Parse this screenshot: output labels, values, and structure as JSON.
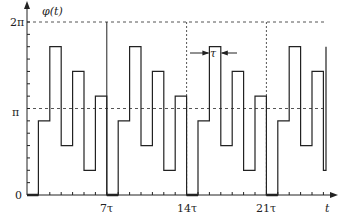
{
  "chart_data": {
    "type": "line",
    "subtype": "step",
    "title": "",
    "ylabel": "φ(t)",
    "xlabel": "t",
    "y_tick_labels": [
      "0",
      "π",
      "2π"
    ],
    "y_tick_values_over_pi": [
      0,
      1,
      2
    ],
    "y_minor_ticks": 14,
    "y_unit": "π/7",
    "x_tick_labels": [
      "7τ",
      "14τ",
      "21τ"
    ],
    "x_tick_values_tau": [
      7,
      14,
      21
    ],
    "x_unit": "τ",
    "ylim": [
      0,
      2
    ],
    "xlim_tau": [
      0,
      26.4
    ],
    "reference_lines": {
      "horizontal_dashed": [
        "π",
        "2π"
      ],
      "vertical": [
        {
          "at": "7τ",
          "style": "solid"
        },
        {
          "at": "14τ",
          "style": "dotted"
        },
        {
          "at": "21τ",
          "style": "dotted"
        }
      ]
    },
    "annotation": {
      "text": "τ",
      "meaning": "segment width",
      "segment_start_tau": 16
    },
    "series": [
      {
        "name": "φ(t)",
        "segment_width": "τ",
        "levels_in_pi_over_7": [
          0,
          6,
          12,
          4,
          10,
          2,
          8,
          0,
          6,
          12,
          4,
          10,
          2,
          8,
          0,
          6,
          12,
          4,
          10,
          2,
          8,
          0,
          6,
          12,
          4,
          10,
          2
        ],
        "period_tau": 7,
        "pattern_per_period": [
          0,
          6,
          12,
          4,
          10,
          2,
          8
        ]
      }
    ]
  },
  "labels": {
    "y_axis": "φ(t)",
    "x_axis": "t",
    "y0": "0",
    "ypi": "π",
    "y2pi": "2π",
    "x7": "7τ",
    "x14": "14τ",
    "x21": "21τ",
    "tau": "τ"
  }
}
